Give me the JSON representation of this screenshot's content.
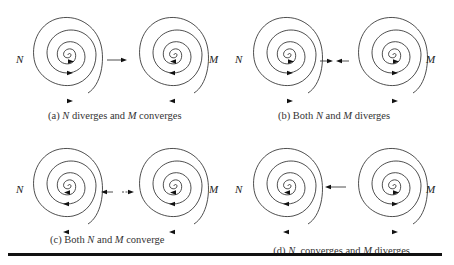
{
  "panels": [
    {
      "id": "a",
      "caption_prefix": "(a) ",
      "n_label": "N",
      "caption_mid": " diverges and ",
      "m_label": "M",
      "caption_suffix": " converges",
      "n_behavior": "diverges",
      "m_behavior": "converges",
      "middle_arrows": "right"
    },
    {
      "id": "b",
      "caption_prefix": "(b) Both ",
      "n_label": "N",
      "caption_mid": " and ",
      "m_label": "M",
      "caption_suffix": " diverges",
      "n_behavior": "diverges",
      "m_behavior": "diverges",
      "middle_arrows": "inward"
    },
    {
      "id": "c",
      "caption_prefix": "(c) Both ",
      "n_label": "N",
      "caption_mid": " and ",
      "m_label": "M",
      "caption_suffix": " converge",
      "n_behavior": "converges",
      "m_behavior": "converges",
      "middle_arrows": "outward"
    },
    {
      "id": "d",
      "caption_prefix": "(d) ",
      "n_label": "N",
      "caption_mid": "  converges and ",
      "m_label": "M",
      "caption_suffix": " diverges",
      "n_behavior": "converges",
      "m_behavior": "diverges",
      "middle_arrows": "left"
    }
  ],
  "labels": {
    "n": "N",
    "m": "M"
  }
}
